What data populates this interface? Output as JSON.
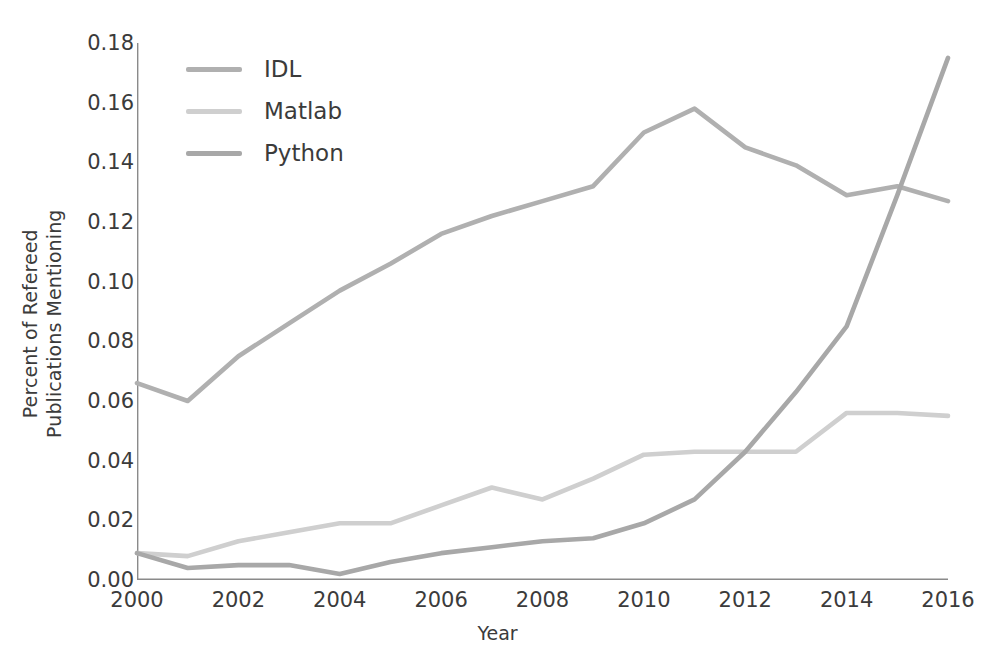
{
  "chart_data": {
    "type": "line",
    "title": "",
    "xlabel": "Year",
    "ylabel": "Percent of Refereed\nPublications Mentioning",
    "xlim": [
      2000,
      2016
    ],
    "ylim": [
      0.0,
      0.18
    ],
    "grid": false,
    "legend_position": "upper-left",
    "xticks": [
      "2000",
      "2002",
      "2004",
      "2006",
      "2008",
      "2010",
      "2012",
      "2014",
      "2016"
    ],
    "xtick_values": [
      2000,
      2002,
      2004,
      2006,
      2008,
      2010,
      2012,
      2014,
      2016
    ],
    "yticks": [
      "0.00",
      "0.02",
      "0.04",
      "0.06",
      "0.08",
      "0.10",
      "0.12",
      "0.14",
      "0.16",
      "0.18"
    ],
    "ytick_values": [
      0.0,
      0.02,
      0.04,
      0.06,
      0.08,
      0.1,
      0.12,
      0.14,
      0.16,
      0.18
    ],
    "x": [
      2000,
      2001,
      2002,
      2003,
      2004,
      2005,
      2006,
      2007,
      2008,
      2009,
      2010,
      2011,
      2012,
      2013,
      2014,
      2015,
      2016
    ],
    "series": [
      {
        "name": "IDL",
        "color": "#b0b0b0",
        "values": [
          0.066,
          0.06,
          0.075,
          0.086,
          0.097,
          0.106,
          0.116,
          0.122,
          0.127,
          0.132,
          0.15,
          0.158,
          0.145,
          0.139,
          0.129,
          0.132,
          0.127
        ]
      },
      {
        "name": "Matlab",
        "color": "#cfcfcf",
        "values": [
          0.009,
          0.008,
          0.013,
          0.016,
          0.019,
          0.019,
          0.025,
          0.031,
          0.027,
          0.034,
          0.042,
          0.043,
          0.043,
          0.043,
          0.056,
          0.056,
          0.055
        ]
      },
      {
        "name": "Python",
        "color": "#a8a8a8",
        "values": [
          0.009,
          0.004,
          0.005,
          0.005,
          0.002,
          0.006,
          0.009,
          0.011,
          0.013,
          0.014,
          0.019,
          0.027,
          0.043,
          0.063,
          0.085,
          0.129,
          0.175
        ]
      }
    ]
  },
  "legend": {
    "items": [
      {
        "label": "IDL"
      },
      {
        "label": "Matlab"
      },
      {
        "label": "Python"
      }
    ]
  },
  "axes": {
    "spine_color": "#8a8a8a",
    "text_color": "#3b3b3b"
  }
}
